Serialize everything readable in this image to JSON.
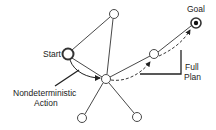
{
  "labels": {
    "start": "Start",
    "goal": "Goal",
    "action_line1": "Nondeterministic",
    "action_line2": "Action",
    "plan_line1": "Full",
    "plan_line2": "Plan"
  },
  "nodes": [
    {
      "id": "start",
      "x": 68,
      "y": 54,
      "r": 5.5,
      "style": "thick"
    },
    {
      "id": "top",
      "x": 114,
      "y": 14,
      "r": 4.5,
      "style": "normal"
    },
    {
      "id": "center",
      "x": 106,
      "y": 79,
      "r": 4.5,
      "style": "normal"
    },
    {
      "id": "right-middle",
      "x": 154,
      "y": 54,
      "r": 4.5,
      "style": "normal"
    },
    {
      "id": "goal",
      "x": 196,
      "y": 23,
      "r": 5,
      "style": "bullseye"
    },
    {
      "id": "bottom-left",
      "x": 82,
      "y": 118,
      "r": 4.5,
      "style": "normal"
    },
    {
      "id": "bottom-right",
      "x": 137,
      "y": 117,
      "r": 4.5,
      "style": "normal"
    }
  ],
  "colors": {
    "stroke": "#222222",
    "background": "#ffffff"
  }
}
